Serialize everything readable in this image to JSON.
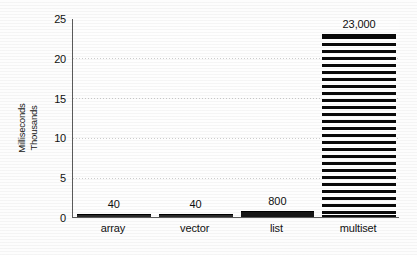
{
  "chart_data": {
    "type": "bar",
    "title": "",
    "subtitle": "",
    "xlabel": "",
    "ylabel": "Milliseconds Thousands",
    "ylabel_lines": [
      "Milliseconds",
      "Thousands"
    ],
    "categories": [
      "array",
      "vector",
      "list",
      "multiset"
    ],
    "values": [
      0.04,
      0.04,
      0.8,
      23.0
    ],
    "value_labels": [
      "40",
      "40",
      "800",
      "23,000"
    ],
    "units": "milliseconds",
    "value_scale_note": "axis in thousands of milliseconds",
    "ylim": [
      0,
      25
    ],
    "ytick_labels": [
      "0",
      "5",
      "10",
      "15",
      "20",
      "25"
    ],
    "ytick_values": [
      0,
      5,
      10,
      15,
      20,
      25
    ],
    "grid": true,
    "grid_axis": "y",
    "legend": false,
    "legend_position": "none",
    "bar_styles": [
      "solid",
      "solid",
      "solid",
      "horizontal-hatch"
    ],
    "colors": {
      "bar_fill": "#161616",
      "bar_hatch_dark": "#0a0a0a",
      "bar_hatch_light": "#ffffff",
      "axis": "#5b5b5b",
      "grid": "#828282",
      "text": "#111111",
      "background": "#fefefe"
    }
  }
}
